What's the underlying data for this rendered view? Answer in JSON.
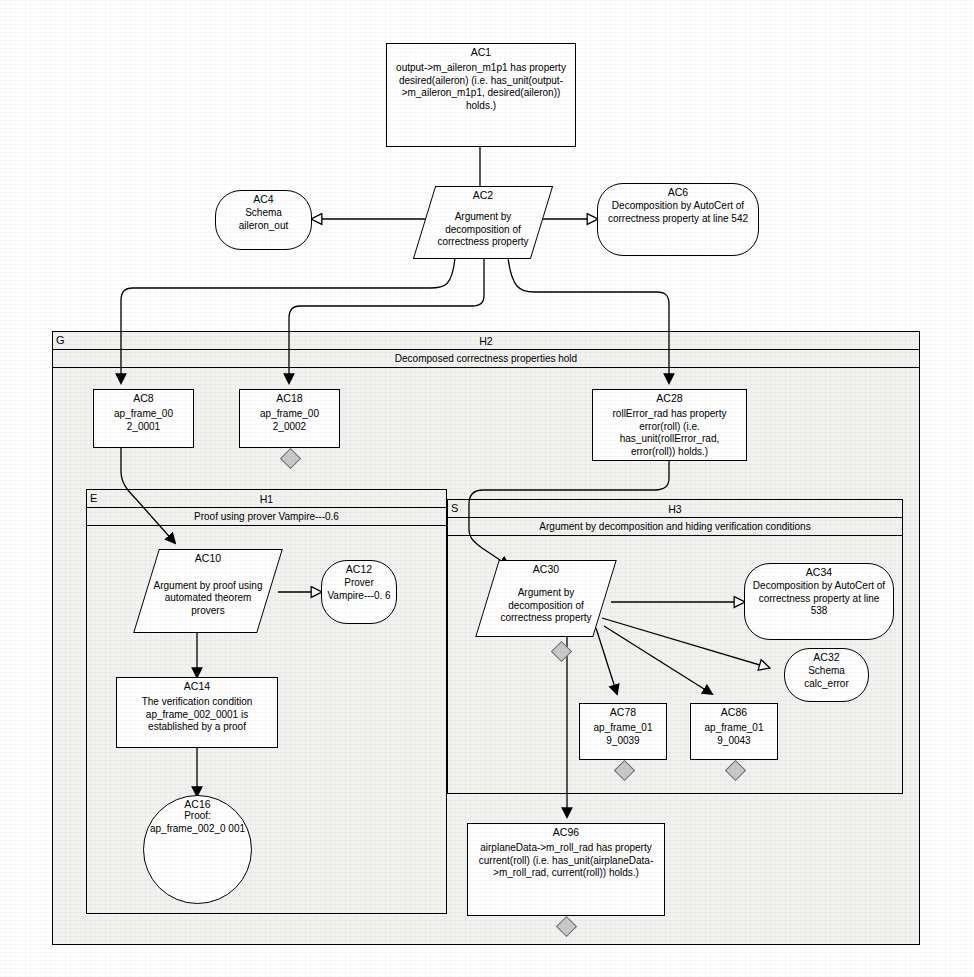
{
  "diagram": {
    "type": "goal-structuring-notation",
    "canvas": {
      "width": 974,
      "height": 977
    },
    "colors": {
      "line": "#000000",
      "module_fill": "#f2f2f0",
      "diamond_fill": "#c9c9c9",
      "page": "#ffffff"
    }
  },
  "nodes": {
    "ac1": {
      "id": "AC1",
      "shape": "rect",
      "text": "output->m_aileron_m1p1 has property desired(aileron) (i.e. has_unit(output->m_aileron_m1p1, desired(aileron)) holds.)"
    },
    "ac2": {
      "id": "AC2",
      "shape": "parallelogram",
      "text": "Argument by decomposition of correctness property"
    },
    "ac4": {
      "id": "AC4",
      "shape": "stadium",
      "text": "Schema aileron_out"
    },
    "ac6": {
      "id": "AC6",
      "shape": "stadium",
      "text": "Decomposition by AutoCert of correctness property at line 542"
    },
    "ac8": {
      "id": "AC8",
      "shape": "rect",
      "text": "ap_frame_00 2_0001"
    },
    "ac18": {
      "id": "AC18",
      "shape": "rect",
      "text": "ap_frame_00 2_0002"
    },
    "ac28": {
      "id": "AC28",
      "shape": "rect",
      "text": "rollError_rad has property error(roll) (i.e. has_unit(rollError_rad, error(roll)) holds.)"
    },
    "ac10": {
      "id": "AC10",
      "shape": "parallelogram",
      "text": "Argument by proof using automated theorem provers"
    },
    "ac12": {
      "id": "AC12",
      "shape": "stadium",
      "text": "Prover Vampire---0. 6"
    },
    "ac14": {
      "id": "AC14",
      "shape": "rect",
      "text": "The verification condition ap_frame_002_0001 is established by a proof"
    },
    "ac16": {
      "id": "AC16",
      "shape": "circle",
      "text": "Proof: ap_frame_002_0 001"
    },
    "ac30": {
      "id": "AC30",
      "shape": "parallelogram",
      "text": "Argument by decomposition of correctness property"
    },
    "ac34": {
      "id": "AC34",
      "shape": "stadium",
      "text": "Decomposition by AutoCert of correctness property at line 538"
    },
    "ac32": {
      "id": "AC32",
      "shape": "stadium",
      "text": "Schema calc_error"
    },
    "ac78": {
      "id": "AC78",
      "shape": "rect",
      "text": "ap_frame_01 9_0039"
    },
    "ac86": {
      "id": "AC86",
      "shape": "rect",
      "text": "ap_frame_01 9_0043"
    },
    "ac96": {
      "id": "AC96",
      "shape": "rect",
      "text": "airplaneData->m_roll_rad has property current(roll) (i.e. has_unit(airplaneData->m_roll_rad, current(roll)) holds.)"
    }
  },
  "modules": {
    "g_h2": {
      "tag": "G",
      "id": "H2",
      "subtitle": "Decomposed correctness properties hold"
    },
    "e_h1": {
      "tag": "E",
      "id": "H1",
      "subtitle": "Proof using prover Vampire---0.6"
    },
    "s_h3": {
      "tag": "S",
      "id": "H3",
      "subtitle": "Argument by decomposition and hiding verification conditions"
    }
  },
  "edges": [
    {
      "from": "AC1",
      "to": "AC2",
      "marker": "none"
    },
    {
      "from": "AC2",
      "to": "AC4",
      "marker": "hollow-arrow"
    },
    {
      "from": "AC2",
      "to": "AC6",
      "marker": "hollow-arrow"
    },
    {
      "from": "AC2",
      "to": "AC8",
      "marker": "solid-arrow"
    },
    {
      "from": "AC2",
      "to": "AC18",
      "marker": "solid-arrow"
    },
    {
      "from": "AC2",
      "to": "AC28",
      "marker": "solid-arrow"
    },
    {
      "from": "AC8",
      "to": "AC10",
      "marker": "solid-arrow"
    },
    {
      "from": "AC10",
      "to": "AC12",
      "marker": "hollow-arrow"
    },
    {
      "from": "AC10",
      "to": "AC14",
      "marker": "solid-arrow"
    },
    {
      "from": "AC14",
      "to": "AC16",
      "marker": "solid-arrow"
    },
    {
      "from": "AC28",
      "to": "AC30",
      "marker": "solid-arrow"
    },
    {
      "from": "AC30",
      "to": "AC34",
      "marker": "hollow-arrow"
    },
    {
      "from": "AC30",
      "to": "AC32",
      "marker": "hollow-arrow"
    },
    {
      "from": "AC30",
      "to": "AC78",
      "marker": "solid-arrow"
    },
    {
      "from": "AC30",
      "to": "AC86",
      "marker": "solid-arrow"
    },
    {
      "from": "AC30",
      "to": "AC96",
      "marker": "solid-arrow"
    }
  ],
  "undeveloped_markers": [
    "AC18",
    "AC30",
    "AC78",
    "AC86",
    "AC96"
  ]
}
